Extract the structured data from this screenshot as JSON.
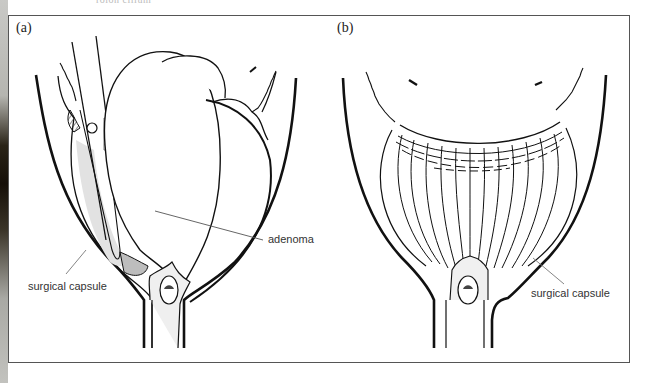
{
  "figure": {
    "top_caption": "rolon cilium",
    "panels": [
      {
        "id": "a",
        "label": "(a)",
        "annotations": [
          {
            "text": "adenoma"
          },
          {
            "text": "surgical capsule"
          }
        ]
      },
      {
        "id": "b",
        "label": "(b)",
        "annotations": [
          {
            "text": "surgical capsule"
          }
        ]
      }
    ],
    "colors": {
      "line": "#111111",
      "leader": "#555555",
      "shade": "#cfcfcf",
      "frame": "#555555"
    }
  }
}
